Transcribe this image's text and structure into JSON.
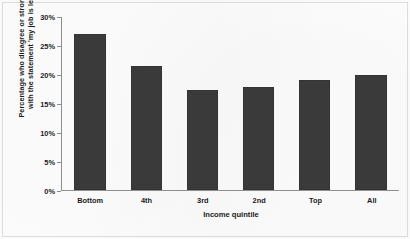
{
  "chart_data": {
    "type": "bar",
    "title": "",
    "categories": [
      "Bottom",
      "4th",
      "3rd",
      "2nd",
      "Top",
      "All"
    ],
    "values": [
      27.0,
      21.5,
      17.3,
      17.8,
      19.0,
      20.0
    ],
    "xlabel": "Income quintile",
    "ylabel_line1": "Percentage who disagree or strongly disagree",
    "ylabel_line2": "with the statement 'my job is less secure'",
    "ylim": [
      0,
      30
    ],
    "ytick_labels": [
      "30%",
      "25%",
      "20%",
      "15%",
      "10%",
      "5%",
      "0%"
    ],
    "ytick_values": [
      30,
      25,
      20,
      15,
      10,
      5,
      0
    ],
    "grid": false,
    "legend": "none",
    "bar_color": "#3a3a3a",
    "axis_color": "#8e8e8e",
    "text_color": "#1c1c1c",
    "background_color": "#fdfdfd"
  }
}
